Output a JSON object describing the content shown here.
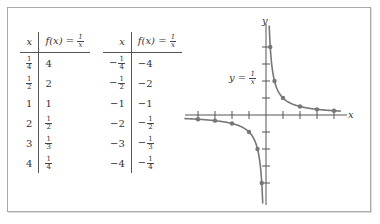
{
  "figure": {
    "table_left": {
      "headers": [
        "x",
        "f(x) = 1/x"
      ],
      "rows": [
        {
          "x": {
            "sign": "",
            "num": "1",
            "den": "4"
          },
          "fx": {
            "sign": "",
            "text": "4"
          }
        },
        {
          "x": {
            "sign": "",
            "num": "1",
            "den": "2"
          },
          "fx": {
            "sign": "",
            "text": "2"
          }
        },
        {
          "x": {
            "sign": "",
            "text": "1"
          },
          "fx": {
            "sign": "",
            "text": "1"
          }
        },
        {
          "x": {
            "sign": "",
            "text": "2"
          },
          "fx": {
            "sign": "",
            "num": "1",
            "den": "2"
          }
        },
        {
          "x": {
            "sign": "",
            "text": "3"
          },
          "fx": {
            "sign": "",
            "num": "1",
            "den": "3"
          }
        },
        {
          "x": {
            "sign": "",
            "text": "4"
          },
          "fx": {
            "sign": "",
            "num": "1",
            "den": "4"
          }
        }
      ]
    },
    "table_right": {
      "headers": [
        "x",
        "f(x) = 1/x"
      ],
      "rows": [
        {
          "x": {
            "sign": "−",
            "num": "1",
            "den": "4"
          },
          "fx": {
            "sign": "",
            "text": "−4"
          }
        },
        {
          "x": {
            "sign": "−",
            "num": "1",
            "den": "2"
          },
          "fx": {
            "sign": "",
            "text": "−2"
          }
        },
        {
          "x": {
            "sign": "",
            "text": "−1"
          },
          "fx": {
            "sign": "",
            "text": "−1"
          }
        },
        {
          "x": {
            "sign": "",
            "text": "−2"
          },
          "fx": {
            "sign": "−",
            "num": "1",
            "den": "2"
          }
        },
        {
          "x": {
            "sign": "",
            "text": "−3"
          },
          "fx": {
            "sign": "−",
            "num": "1",
            "den": "3"
          }
        },
        {
          "x": {
            "sign": "",
            "text": "−4"
          },
          "fx": {
            "sign": "−",
            "num": "1",
            "den": "4"
          }
        }
      ]
    },
    "graph": {
      "x_axis_label": "x",
      "y_axis_label": "y",
      "curve_label_lhs": "y =",
      "curve_label_num": "1",
      "curve_label_den": "x",
      "curve_color": "#777777",
      "point_color": "#777777"
    }
  },
  "chart_data": {
    "type": "line",
    "title": "",
    "function": "f(x) = 1/x",
    "xlabel": "x",
    "ylabel": "y",
    "xlim": [
      -5.5,
      5.5
    ],
    "ylim": [
      -5.3,
      5.2
    ],
    "x_ticks": [
      -4,
      -3,
      -2,
      -1,
      1,
      2,
      3,
      4
    ],
    "y_ticks": [
      -4,
      -3,
      -2,
      -1,
      1,
      2,
      3,
      4
    ],
    "grid": false,
    "annotations": [
      "y = 1/x"
    ],
    "series": [
      {
        "name": "f(x) = 1/x (x > 0)",
        "x": [
          0.25,
          0.5,
          1,
          2,
          3,
          4
        ],
        "y": [
          4,
          2,
          1,
          0.5,
          0.3333,
          0.25
        ]
      },
      {
        "name": "f(x) = 1/x (x < 0)",
        "x": [
          -0.25,
          -0.5,
          -1,
          -2,
          -3,
          -4
        ],
        "y": [
          -4,
          -2,
          -1,
          -0.5,
          -0.3333,
          -0.25
        ]
      }
    ]
  }
}
